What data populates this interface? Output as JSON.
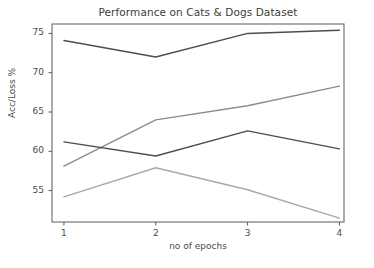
{
  "chart_data": {
    "type": "line",
    "title": "Performance on Cats & Dogs Dataset",
    "xlabel": "no of epochs",
    "ylabel": "Acc/Loss %",
    "x": [
      1,
      2,
      3,
      4
    ],
    "xtick_labels": [
      "1",
      "2",
      "3",
      "4"
    ],
    "ytick_labels": [
      "55",
      "60",
      "65",
      "70",
      "75"
    ],
    "ytick_values": [
      55,
      60,
      65,
      70,
      75
    ],
    "xlim": [
      0.87,
      4.05
    ],
    "ylim": [
      51.0,
      76.2
    ],
    "grid": false,
    "legend": "none",
    "series": [
      {
        "name": "series-1",
        "color": "#4d4d4d",
        "values": [
          74.1,
          72.0,
          75.0,
          75.4
        ]
      },
      {
        "name": "series-2",
        "color": "#8c8c8c",
        "values": [
          58.1,
          64.0,
          65.8,
          68.3
        ]
      },
      {
        "name": "series-3",
        "color": "#4d4d4d",
        "values": [
          61.2,
          59.4,
          62.6,
          60.3
        ]
      },
      {
        "name": "series-4",
        "color": "#a8a8a8",
        "values": [
          54.2,
          57.9,
          55.1,
          51.5
        ]
      }
    ],
    "axes_frame_color": "#5a5a5a",
    "background_color": "#ffffff"
  }
}
